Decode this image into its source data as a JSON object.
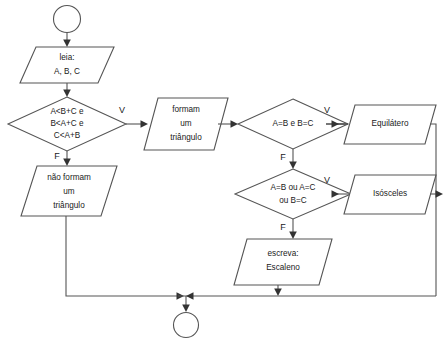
{
  "diagram": {
    "colors": {
      "background": "#ffffff",
      "shape_fill": "#ffffff",
      "shape_stroke": "#555555",
      "connector": "#555555",
      "arrow": "#333333",
      "text": "#1a1a1a"
    }
  },
  "nodes": {
    "start": {
      "label": "",
      "shape": "circle"
    },
    "read": {
      "shape": "parallelogram",
      "line1": "leia:",
      "line2": "A, B, C"
    },
    "decision_triangle": {
      "shape": "diamond",
      "line1": "A<B+C e",
      "line2": "B<A+C e",
      "line3": "C<A+B"
    },
    "out_forms": {
      "shape": "parallelogram",
      "line1": "formam",
      "line2": "um",
      "line3": "triângulo"
    },
    "out_not_forms": {
      "shape": "parallelogram",
      "line1": "não formam",
      "line2": "um",
      "line3": "triângulo"
    },
    "decision_equilateral": {
      "shape": "diamond",
      "line1": "A=B e B=C"
    },
    "out_equilateral": {
      "shape": "parallelogram",
      "line1": "Equilátero"
    },
    "decision_isosceles": {
      "shape": "diamond",
      "line1": "A=B ou  A=C",
      "line2": "ou B=C"
    },
    "out_isosceles": {
      "shape": "parallelogram",
      "line1": "Isósceles"
    },
    "out_scalene": {
      "shape": "parallelogram",
      "line1": "escreva:",
      "line2": "Escaleno"
    },
    "end": {
      "label": "",
      "shape": "circle"
    }
  },
  "branch_labels": {
    "triangle_true": "V",
    "triangle_false": "F",
    "equilateral_true": "V",
    "equilateral_false": "F",
    "isosceles_true": "V",
    "isosceles_false": "F"
  }
}
